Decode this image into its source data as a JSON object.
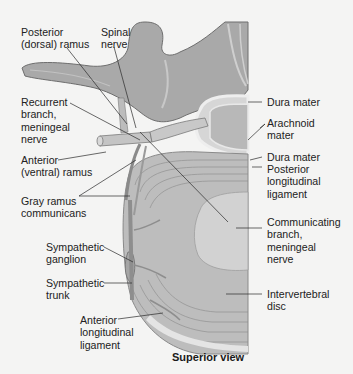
{
  "figure": {
    "view_caption": "Superior view",
    "colors": {
      "background": "#f4f4f3",
      "bone": "#a9a9a9",
      "bone_shadow": "#7d7d7d",
      "disc": "#bdbdbd",
      "disc_rings": "#8f8f8f",
      "nucleus": "#cfcfcf",
      "nerve": "#c4c4c4",
      "dura": "#e6e6e6",
      "leader_line": "#2a2a2a"
    },
    "labels_left": [
      {
        "id": "posterior-dorsal-ramus",
        "text": "Posterior\n(dorsal) ramus"
      },
      {
        "id": "spinal-nerve",
        "text": "Spinal\nnerve"
      },
      {
        "id": "recurrent-branch-meningeal-nerve",
        "text": "Recurrent\nbranch,\nmeningeal\nnerve"
      },
      {
        "id": "anterior-ventral-ramus",
        "text": "Anterior\n(ventral) ramus"
      },
      {
        "id": "gray-ramus-communicans",
        "text": "Gray ramus\ncommunicans"
      },
      {
        "id": "sympathetic-ganglion",
        "text": "Sympathetic\nganglion"
      },
      {
        "id": "sympathetic-trunk",
        "text": "Sympathetic\ntrunk"
      },
      {
        "id": "anterior-longitudinal-ligament",
        "text": "Anterior\nlongitudinal\nligament"
      }
    ],
    "labels_right": [
      {
        "id": "dura-mater-top",
        "text": "Dura mater"
      },
      {
        "id": "arachnoid-mater",
        "text": "Arachnoid\nmater"
      },
      {
        "id": "dura-mater-bottom",
        "text": "Dura mater"
      },
      {
        "id": "posterior-longitudinal-ligament",
        "text": "Posterior\nlongitudinal\nligament"
      },
      {
        "id": "communicating-branch-meningeal-nerve",
        "text": "Communicating\nbranch,\nmeningeal\nnerve"
      },
      {
        "id": "intervertebral-disc",
        "text": "Intervertebral\ndisc"
      }
    ]
  }
}
